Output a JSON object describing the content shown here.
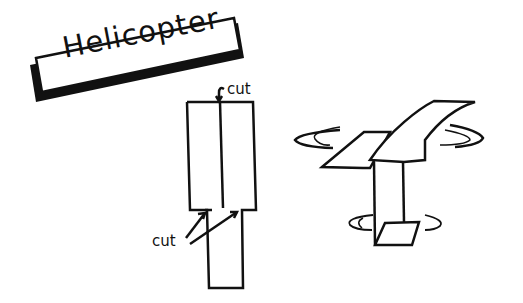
{
  "title": "Helicopter",
  "labels": {
    "cut_top": "cut",
    "cut_bottom": "cut"
  },
  "figures": [
    {
      "name": "flat-template",
      "description": "Rectangle paper strip with center cut from top and two side cuts"
    },
    {
      "name": "folded-helicopter",
      "description": "Folded paper helicopter with spinning rotor blades"
    }
  ]
}
